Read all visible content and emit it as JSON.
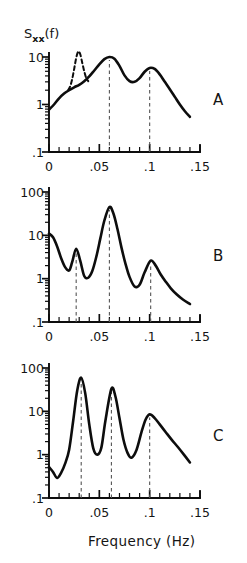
{
  "figure": {
    "y_axis_label": "S",
    "y_axis_label_sub": "xx",
    "y_axis_label_tail": "(f)",
    "x_axis_title": "Frequency (Hz)",
    "panel_labels": [
      "A",
      "B",
      "C"
    ],
    "ink_color": "#0d0d0d",
    "guide_color": "#555555",
    "background": "#ffffff"
  },
  "chart_data": [
    {
      "type": "line",
      "panel": "A",
      "title": "",
      "xlabel": "Frequency (Hz)",
      "ylabel": "Sxx(f)",
      "xlim": [
        0,
        0.15
      ],
      "ylim": [
        0.1,
        30
      ],
      "yscale": "log",
      "grid": false,
      "legend": "none",
      "xticks": [
        0,
        0.05,
        0.1,
        0.15
      ],
      "xticklabels": [
        "0",
        ".05",
        ".1",
        ".15"
      ],
      "xminor_step": 0.01,
      "yticks": [
        0.1,
        1,
        10
      ],
      "yticklabels": [
        ".1",
        "1",
        "10"
      ],
      "annotations": [
        "A"
      ],
      "guide_lines_x": [
        0.06,
        0.1
      ],
      "series": [
        {
          "name": "measured-spectrum",
          "style": "solid",
          "x": [
            0.0,
            0.005,
            0.01,
            0.015,
            0.02,
            0.025,
            0.03,
            0.035,
            0.04,
            0.045,
            0.05,
            0.055,
            0.06,
            0.065,
            0.07,
            0.075,
            0.08,
            0.085,
            0.09,
            0.095,
            0.1,
            0.105,
            0.11,
            0.115,
            0.12,
            0.125,
            0.13,
            0.135,
            0.14
          ],
          "y": [
            0.78,
            1.0,
            1.35,
            1.7,
            2.0,
            2.3,
            2.6,
            3.1,
            3.9,
            5.2,
            7.0,
            9.0,
            10.0,
            9.2,
            6.5,
            4.1,
            3.1,
            3.0,
            3.6,
            4.9,
            5.9,
            5.6,
            4.3,
            3.0,
            2.1,
            1.45,
            1.0,
            0.72,
            0.55
          ]
        },
        {
          "name": "theoretical-peak",
          "style": "dashed",
          "x": [
            0.019,
            0.021,
            0.023,
            0.025,
            0.027,
            0.029,
            0.031,
            0.033,
            0.035,
            0.037,
            0.039
          ],
          "y": [
            2.0,
            2.4,
            3.4,
            5.6,
            9.5,
            13.0,
            11.5,
            7.6,
            5.0,
            3.6,
            3.1
          ]
        }
      ]
    },
    {
      "type": "line",
      "panel": "B",
      "title": "",
      "xlabel": "Frequency (Hz)",
      "ylabel": "Sxx(f)",
      "xlim": [
        0,
        0.15
      ],
      "ylim": [
        0.1,
        100
      ],
      "yscale": "log",
      "grid": false,
      "legend": "none",
      "xticks": [
        0,
        0.05,
        0.1,
        0.15
      ],
      "xticklabels": [
        "0",
        ".05",
        ".1",
        ".15"
      ],
      "xminor_step": 0.01,
      "yticks": [
        0.1,
        1,
        10,
        100
      ],
      "yticklabels": [
        ".1",
        "1",
        "10",
        "100"
      ],
      "annotations": [
        "B"
      ],
      "guide_lines_x": [
        0.027,
        0.06,
        0.101
      ],
      "series": [
        {
          "name": "measured-spectrum",
          "style": "solid",
          "x": [
            0.0,
            0.004,
            0.008,
            0.012,
            0.016,
            0.02,
            0.023,
            0.027,
            0.031,
            0.035,
            0.039,
            0.043,
            0.047,
            0.051,
            0.055,
            0.06,
            0.064,
            0.068,
            0.072,
            0.076,
            0.08,
            0.085,
            0.09,
            0.095,
            0.101,
            0.106,
            0.111,
            0.116,
            0.121,
            0.127,
            0.133,
            0.14
          ],
          "y": [
            11.0,
            9.0,
            5.6,
            3.0,
            1.85,
            1.55,
            2.4,
            4.9,
            2.6,
            1.15,
            1.05,
            1.5,
            3.2,
            8.5,
            22.0,
            45.0,
            32.0,
            14.0,
            5.2,
            2.2,
            1.1,
            0.66,
            0.72,
            1.4,
            2.6,
            2.0,
            1.25,
            0.85,
            0.6,
            0.43,
            0.33,
            0.26
          ]
        }
      ]
    },
    {
      "type": "line",
      "panel": "C",
      "title": "",
      "xlabel": "Frequency (Hz)",
      "ylabel": "Sxx(f)",
      "xlim": [
        0,
        0.15
      ],
      "ylim": [
        0.1,
        100
      ],
      "yscale": "log",
      "grid": false,
      "legend": "none",
      "xticks": [
        0,
        0.05,
        0.1,
        0.15
      ],
      "xticklabels": [
        "0",
        ".05",
        ".1",
        ".15"
      ],
      "xminor_step": 0.01,
      "yticks": [
        0.1,
        1,
        10,
        100
      ],
      "yticklabels": [
        ".1",
        "1",
        "10",
        "100"
      ],
      "annotations": [
        "C"
      ],
      "guide_lines_x": [
        0.032,
        0.062,
        0.1
      ],
      "series": [
        {
          "name": "measured-spectrum",
          "style": "solid",
          "x": [
            0.0,
            0.004,
            0.008,
            0.012,
            0.016,
            0.02,
            0.024,
            0.028,
            0.032,
            0.036,
            0.04,
            0.044,
            0.048,
            0.052,
            0.056,
            0.062,
            0.066,
            0.07,
            0.074,
            0.078,
            0.082,
            0.087,
            0.092,
            0.096,
            0.1,
            0.105,
            0.11,
            0.116,
            0.122,
            0.128,
            0.134,
            0.14
          ],
          "y": [
            0.52,
            0.4,
            0.29,
            0.38,
            0.62,
            1.3,
            6.0,
            30.0,
            60.0,
            26.0,
            5.0,
            1.4,
            1.0,
            1.45,
            6.0,
            33.0,
            22.0,
            7.0,
            2.2,
            1.1,
            0.85,
            1.3,
            3.4,
            6.5,
            8.5,
            7.0,
            5.0,
            3.3,
            2.2,
            1.5,
            1.0,
            0.66
          ]
        }
      ]
    }
  ]
}
